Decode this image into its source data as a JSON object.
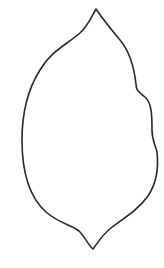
{
  "figure": {
    "stroke_color": "#2a2a2a",
    "background_color": "#ffffff",
    "stroke_width": 1.6
  }
}
